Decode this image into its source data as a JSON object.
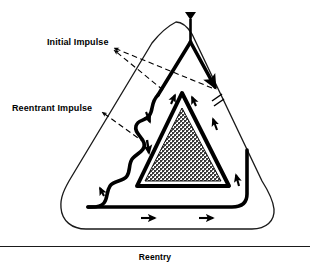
{
  "figure": {
    "caption": "Reentry",
    "labels": {
      "initial_impulse": "Initial Impulse",
      "reentrant_impulse": "Reentrant Impulse"
    },
    "colors": {
      "ink": "#000000",
      "thin_stroke": "#1a1a1a",
      "stipple_fill": "#6f6f6f",
      "background": "#ffffff"
    },
    "elements": {
      "apex_marker": "inverted-triangle-arrowhead",
      "conduction_block_marker": "double-slash",
      "inner_triangle_fill": "stipple-halftone"
    },
    "flow_arrows": {
      "bottom": [
        "right",
        "right"
      ],
      "right_side": [
        "up",
        "up"
      ],
      "inner_apex": [
        "up",
        "up"
      ],
      "left_wave": [
        "down",
        "down",
        "up"
      ]
    }
  }
}
